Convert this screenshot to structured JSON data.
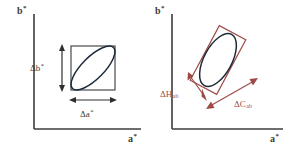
{
  "figure": {
    "background_color": "#ffffff",
    "width": 292,
    "height": 148
  },
  "colors": {
    "axis": "#3c3c3c",
    "ellipse": "#1d2a3a",
    "square_box": "#4a4a4a",
    "rotated_box": "#9e4b48",
    "annotation_red": "#9e4b48",
    "annotation_dark": "#3a3a3a"
  },
  "panels": [
    {
      "id": "left",
      "name": "rectangular-tolerance-panel",
      "axes": {
        "y_label": "b",
        "y_label_star": "*",
        "x_label": "a",
        "x_label_star": "*"
      },
      "shapes": {
        "box": {
          "type": "square",
          "rotation_deg": 0,
          "stroke": "#4a4a4a"
        },
        "ellipse": {
          "type": "ellipse",
          "rotation_deg": -45,
          "stroke": "#1d2a3a"
        }
      },
      "annotations": [
        {
          "name": "delta-b-annotation",
          "label": "Δb",
          "superscript": "*",
          "subscript": "",
          "arrow": "vertical-double-arrow",
          "color": "#3a3a3a"
        },
        {
          "name": "delta-a-annotation",
          "label": "Δa",
          "superscript": "*",
          "subscript": "",
          "arrow": "horizontal-double-arrow",
          "color": "#3a3a3a"
        }
      ]
    },
    {
      "id": "right",
      "name": "chroma-hue-tolerance-panel",
      "axes": {
        "y_label": "b",
        "y_label_star": "*",
        "x_label": "a",
        "x_label_star": "*"
      },
      "shapes": {
        "box": {
          "type": "rectangle",
          "rotation_deg": -62,
          "stroke": "#9e4b48"
        },
        "ellipse": {
          "type": "ellipse",
          "rotation_deg": -62,
          "stroke": "#1d2a3a"
        }
      },
      "annotations": [
        {
          "name": "delta-h-annotation",
          "label": "ΔH",
          "superscript": "",
          "subscript": "ab",
          "arrow": "short-double-arrow",
          "color": "#9e4b48"
        },
        {
          "name": "delta-c-annotation",
          "label": "ΔC",
          "superscript": "",
          "subscript": "ab",
          "arrow": "long-double-arrow",
          "color": "#9e4b48"
        }
      ]
    }
  ]
}
